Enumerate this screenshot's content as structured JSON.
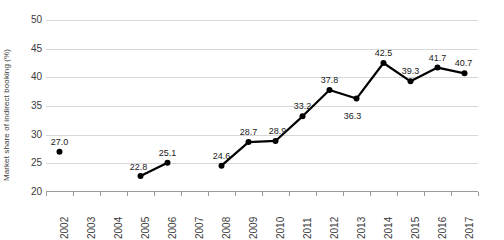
{
  "chart_data": {
    "type": "line",
    "title": "",
    "xlabel": "",
    "ylabel": "Market share of indirect booking (%)",
    "categories": [
      "2002",
      "2003",
      "2004",
      "2005",
      "2006",
      "2007",
      "2008",
      "2009",
      "2010",
      "2011",
      "2012",
      "2013",
      "2014",
      "2015",
      "2016",
      "2017"
    ],
    "values": [
      27.0,
      null,
      null,
      22.8,
      25.1,
      null,
      24.6,
      28.7,
      28.9,
      33.2,
      37.8,
      36.3,
      42.5,
      39.3,
      41.7,
      40.7
    ],
    "data_labels": [
      "27.0",
      "",
      "",
      "22.8",
      "25.1",
      "",
      "24.6",
      "28.7",
      "28.9",
      "33.2",
      "37.8",
      "36.3",
      "42.5",
      "39.3",
      "41.7",
      "40.7"
    ],
    "ylim": [
      20,
      50
    ],
    "yticks": [
      20,
      25,
      30,
      35,
      40,
      45,
      50
    ],
    "ytick_labels": [
      "20",
      "25",
      "30",
      "35",
      "40",
      "45",
      "50"
    ],
    "grid": true,
    "legend": false,
    "legend_position": "none",
    "series_color": "#000000",
    "grid_color": "#d7d7d7",
    "axis_color": "#9a9a9a",
    "marker": "circle",
    "gaps_at": [
      "2003",
      "2004",
      "2007"
    ],
    "series": [
      {
        "name": "Market share of indirect booking",
        "values": [
          27.0,
          null,
          null,
          22.8,
          25.1,
          null,
          24.6,
          28.7,
          28.9,
          33.2,
          37.8,
          36.3,
          42.5,
          39.3,
          41.7,
          40.7
        ]
      }
    ]
  }
}
